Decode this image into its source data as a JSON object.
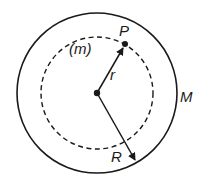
{
  "diagram": {
    "type": "gravitation-shell",
    "colors": {
      "stroke": "#1a1a1a",
      "background": "#ffffff"
    },
    "outer_circle": {
      "cx": 97,
      "cy": 93,
      "r": 80,
      "label": "M",
      "style": "solid"
    },
    "inner_circle": {
      "cx": 97,
      "cy": 93,
      "r": 56,
      "style": "dashed"
    },
    "center_point": {
      "x": 97,
      "y": 93
    },
    "point_P": {
      "x": 125,
      "y": 44,
      "label": "P",
      "mass_label": "(m)"
    },
    "vector_r": {
      "from": [
        97,
        93
      ],
      "to": [
        125,
        44
      ],
      "label": "r"
    },
    "vector_R": {
      "from": [
        97,
        93
      ],
      "to": [
        136,
        162
      ],
      "label": "R"
    }
  },
  "labels": {
    "P": "P",
    "m": "(m)",
    "r": "r",
    "M": "M",
    "R": "R"
  }
}
